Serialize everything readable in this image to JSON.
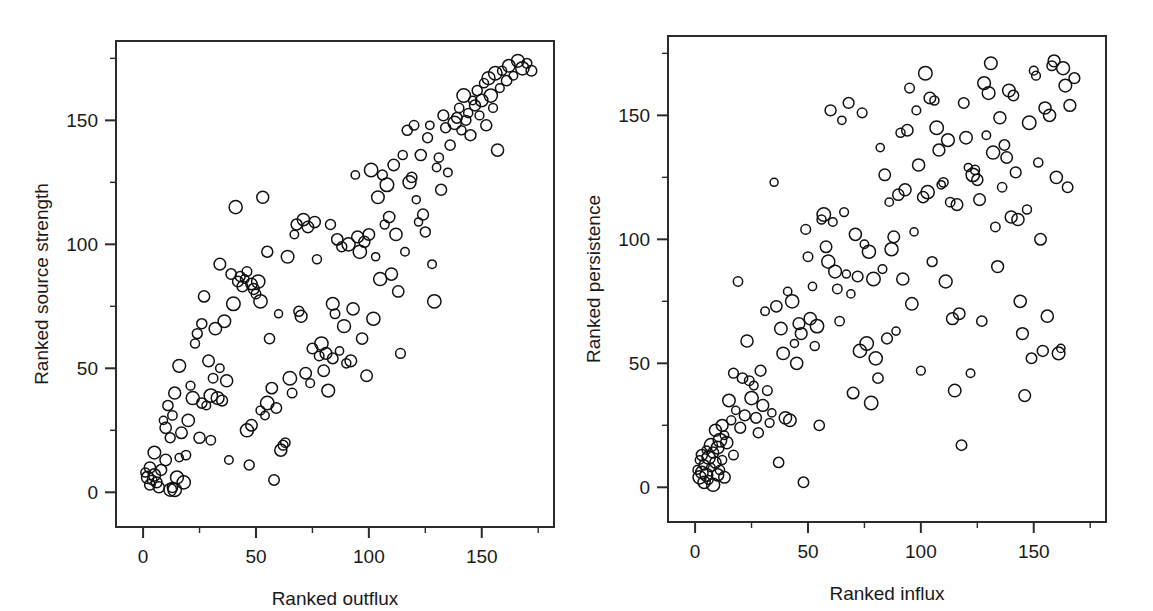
{
  "figure": {
    "background_color": "#fefefe",
    "marker_color": "#111111",
    "axis_color": "#2b2b2b",
    "marker_style": "open-circle"
  },
  "chart_data": [
    {
      "type": "scatter",
      "panel": "left",
      "title": "",
      "xlabel": "Ranked outflux",
      "ylabel": "Ranked source strength",
      "xlim": [
        -12,
        182
      ],
      "ylim": [
        -14,
        182
      ],
      "xticks": [
        0,
        50,
        100,
        150
      ],
      "yticks": [
        0,
        50,
        100,
        150
      ],
      "xticks_minor": [
        25,
        75,
        125,
        175
      ],
      "yticks_minor": [
        25,
        75,
        125,
        175
      ],
      "xtick_labels": [
        "0",
        "50",
        "100",
        "150"
      ],
      "ytick_labels": [
        "0",
        "50",
        "100",
        "150"
      ],
      "grid": false,
      "legend": "none",
      "n_points": 178,
      "points": [
        [
          1,
          8
        ],
        [
          2,
          6
        ],
        [
          3,
          10
        ],
        [
          3,
          3
        ],
        [
          4,
          5
        ],
        [
          5,
          16
        ],
        [
          5,
          7
        ],
        [
          6,
          4
        ],
        [
          7,
          2
        ],
        [
          8,
          9
        ],
        [
          9,
          29
        ],
        [
          10,
          26
        ],
        [
          10,
          13
        ],
        [
          11,
          35
        ],
        [
          12,
          1
        ],
        [
          12,
          22
        ],
        [
          13,
          2
        ],
        [
          13,
          31
        ],
        [
          14,
          1
        ],
        [
          14,
          40
        ],
        [
          15,
          6
        ],
        [
          16,
          51
        ],
        [
          16,
          14
        ],
        [
          17,
          24
        ],
        [
          18,
          4
        ],
        [
          19,
          15
        ],
        [
          20,
          29
        ],
        [
          21,
          43
        ],
        [
          22,
          38
        ],
        [
          23,
          60
        ],
        [
          24,
          64
        ],
        [
          25,
          22
        ],
        [
          26,
          68
        ],
        [
          26,
          36
        ],
        [
          27,
          79
        ],
        [
          28,
          35
        ],
        [
          29,
          53
        ],
        [
          30,
          39
        ],
        [
          30,
          21
        ],
        [
          31,
          46
        ],
        [
          32,
          66
        ],
        [
          33,
          38
        ],
        [
          34,
          92
        ],
        [
          34,
          50
        ],
        [
          35,
          37
        ],
        [
          36,
          69
        ],
        [
          37,
          45
        ],
        [
          38,
          13
        ],
        [
          39,
          88
        ],
        [
          40,
          76
        ],
        [
          41,
          115
        ],
        [
          42,
          85
        ],
        [
          43,
          87
        ],
        [
          44,
          83
        ],
        [
          45,
          86
        ],
        [
          46,
          25
        ],
        [
          46,
          89
        ],
        [
          47,
          11
        ],
        [
          48,
          27
        ],
        [
          48,
          84
        ],
        [
          49,
          82
        ],
        [
          50,
          80
        ],
        [
          51,
          85
        ],
        [
          52,
          77
        ],
        [
          52,
          33
        ],
        [
          53,
          119
        ],
        [
          54,
          31
        ],
        [
          55,
          36
        ],
        [
          55,
          97
        ],
        [
          56,
          62
        ],
        [
          57,
          42
        ],
        [
          58,
          5
        ],
        [
          59,
          34
        ],
        [
          60,
          72
        ],
        [
          61,
          17
        ],
        [
          62,
          19
        ],
        [
          63,
          20
        ],
        [
          64,
          95
        ],
        [
          65,
          46
        ],
        [
          66,
          40
        ],
        [
          67,
          104
        ],
        [
          68,
          108
        ],
        [
          69,
          73
        ],
        [
          70,
          71
        ],
        [
          71,
          110
        ],
        [
          72,
          48
        ],
        [
          73,
          107
        ],
        [
          74,
          44
        ],
        [
          75,
          58
        ],
        [
          76,
          109
        ],
        [
          77,
          94
        ],
        [
          78,
          55
        ],
        [
          79,
          60
        ],
        [
          80,
          49
        ],
        [
          81,
          56
        ],
        [
          82,
          41
        ],
        [
          83,
          108
        ],
        [
          84,
          76
        ],
        [
          84,
          54
        ],
        [
          85,
          72
        ],
        [
          86,
          102
        ],
        [
          87,
          57
        ],
        [
          88,
          99
        ],
        [
          89,
          67
        ],
        [
          90,
          52
        ],
        [
          91,
          100
        ],
        [
          92,
          53
        ],
        [
          93,
          74
        ],
        [
          94,
          128
        ],
        [
          95,
          103
        ],
        [
          96,
          97
        ],
        [
          97,
          62
        ],
        [
          98,
          101
        ],
        [
          99,
          47
        ],
        [
          100,
          104
        ],
        [
          101,
          130
        ],
        [
          102,
          70
        ],
        [
          103,
          95
        ],
        [
          104,
          119
        ],
        [
          105,
          86
        ],
        [
          106,
          128
        ],
        [
          107,
          108
        ],
        [
          108,
          124
        ],
        [
          109,
          111
        ],
        [
          110,
          88
        ],
        [
          111,
          132
        ],
        [
          112,
          104
        ],
        [
          113,
          81
        ],
        [
          114,
          56
        ],
        [
          115,
          136
        ],
        [
          116,
          97
        ],
        [
          117,
          146
        ],
        [
          118,
          125
        ],
        [
          119,
          127
        ],
        [
          120,
          148
        ],
        [
          121,
          118
        ],
        [
          122,
          109
        ],
        [
          123,
          136
        ],
        [
          124,
          112
        ],
        [
          125,
          105
        ],
        [
          126,
          143
        ],
        [
          127,
          148
        ],
        [
          128,
          92
        ],
        [
          129,
          77
        ],
        [
          130,
          131
        ],
        [
          131,
          135
        ],
        [
          132,
          122
        ],
        [
          133,
          152
        ],
        [
          134,
          147
        ],
        [
          135,
          129
        ],
        [
          136,
          140
        ],
        [
          138,
          149
        ],
        [
          139,
          151
        ],
        [
          140,
          155
        ],
        [
          141,
          146
        ],
        [
          142,
          160
        ],
        [
          143,
          150
        ],
        [
          144,
          153
        ],
        [
          145,
          144
        ],
        [
          146,
          158
        ],
        [
          147,
          156
        ],
        [
          148,
          162
        ],
        [
          149,
          152
        ],
        [
          150,
          158
        ],
        [
          151,
          165
        ],
        [
          152,
          148
        ],
        [
          153,
          167
        ],
        [
          154,
          160
        ],
        [
          155,
          155
        ],
        [
          156,
          169
        ],
        [
          157,
          138
        ],
        [
          158,
          163
        ],
        [
          159,
          170
        ],
        [
          161,
          166
        ],
        [
          162,
          172
        ],
        [
          164,
          168
        ],
        [
          166,
          174
        ],
        [
          168,
          171
        ],
        [
          170,
          173
        ],
        [
          172,
          170
        ]
      ]
    },
    {
      "type": "scatter",
      "panel": "right",
      "title": "",
      "xlabel": "Ranked influx",
      "ylabel": "Ranked persistence",
      "xlim": [
        -12,
        182
      ],
      "ylim": [
        -14,
        182
      ],
      "xticks": [
        0,
        50,
        100,
        150
      ],
      "yticks": [
        0,
        50,
        100,
        150
      ],
      "xticks_minor": [
        25,
        75,
        125,
        175
      ],
      "yticks_minor": [
        25,
        75,
        125,
        175
      ],
      "xtick_labels": [
        "0",
        "50",
        "100",
        "150"
      ],
      "ytick_labels": [
        "0",
        "50",
        "100",
        "150"
      ],
      "grid": false,
      "legend": "none",
      "n_points": 176,
      "points": [
        [
          1,
          7
        ],
        [
          2,
          11
        ],
        [
          2,
          4
        ],
        [
          3,
          13
        ],
        [
          3,
          6
        ],
        [
          4,
          9
        ],
        [
          4,
          2
        ],
        [
          5,
          15
        ],
        [
          5,
          5
        ],
        [
          6,
          12
        ],
        [
          6,
          3
        ],
        [
          7,
          17
        ],
        [
          7,
          8
        ],
        [
          8,
          14
        ],
        [
          8,
          1
        ],
        [
          9,
          10
        ],
        [
          9,
          23
        ],
        [
          10,
          16
        ],
        [
          10,
          5
        ],
        [
          11,
          19
        ],
        [
          11,
          7
        ],
        [
          12,
          25
        ],
        [
          12,
          11
        ],
        [
          13,
          21
        ],
        [
          13,
          4
        ],
        [
          14,
          18
        ],
        [
          15,
          35
        ],
        [
          16,
          27
        ],
        [
          17,
          46
        ],
        [
          17,
          13
        ],
        [
          18,
          31
        ],
        [
          19,
          83
        ],
        [
          20,
          24
        ],
        [
          21,
          44
        ],
        [
          22,
          29
        ],
        [
          23,
          59
        ],
        [
          24,
          43
        ],
        [
          25,
          36
        ],
        [
          26,
          41
        ],
        [
          27,
          28
        ],
        [
          28,
          22
        ],
        [
          29,
          47
        ],
        [
          30,
          33
        ],
        [
          31,
          71
        ],
        [
          32,
          39
        ],
        [
          33,
          26
        ],
        [
          34,
          30
        ],
        [
          35,
          123
        ],
        [
          36,
          73
        ],
        [
          37,
          10
        ],
        [
          38,
          64
        ],
        [
          39,
          54
        ],
        [
          40,
          28
        ],
        [
          41,
          79
        ],
        [
          42,
          27
        ],
        [
          43,
          75
        ],
        [
          44,
          58
        ],
        [
          45,
          50
        ],
        [
          46,
          66
        ],
        [
          47,
          62
        ],
        [
          48,
          2
        ],
        [
          49,
          104
        ],
        [
          50,
          93
        ],
        [
          51,
          68
        ],
        [
          52,
          81
        ],
        [
          53,
          57
        ],
        [
          54,
          65
        ],
        [
          55,
          25
        ],
        [
          56,
          108
        ],
        [
          57,
          110
        ],
        [
          58,
          97
        ],
        [
          59,
          91
        ],
        [
          60,
          152
        ],
        [
          61,
          107
        ],
        [
          62,
          87
        ],
        [
          63,
          80
        ],
        [
          64,
          67
        ],
        [
          65,
          148
        ],
        [
          66,
          111
        ],
        [
          67,
          86
        ],
        [
          68,
          155
        ],
        [
          69,
          78
        ],
        [
          70,
          38
        ],
        [
          71,
          102
        ],
        [
          72,
          85
        ],
        [
          73,
          55
        ],
        [
          74,
          151
        ],
        [
          75,
          98
        ],
        [
          76,
          58
        ],
        [
          77,
          95
        ],
        [
          78,
          34
        ],
        [
          79,
          84
        ],
        [
          80,
          52
        ],
        [
          81,
          44
        ],
        [
          82,
          137
        ],
        [
          83,
          88
        ],
        [
          84,
          126
        ],
        [
          85,
          60
        ],
        [
          86,
          115
        ],
        [
          87,
          96
        ],
        [
          88,
          101
        ],
        [
          89,
          63
        ],
        [
          90,
          118
        ],
        [
          91,
          143
        ],
        [
          92,
          84
        ],
        [
          93,
          120
        ],
        [
          94,
          144
        ],
        [
          95,
          161
        ],
        [
          96,
          74
        ],
        [
          97,
          103
        ],
        [
          98,
          152
        ],
        [
          99,
          130
        ],
        [
          100,
          47
        ],
        [
          101,
          117
        ],
        [
          102,
          167
        ],
        [
          103,
          119
        ],
        [
          104,
          157
        ],
        [
          105,
          91
        ],
        [
          106,
          156
        ],
        [
          107,
          145
        ],
        [
          108,
          136
        ],
        [
          109,
          122
        ],
        [
          110,
          123
        ],
        [
          111,
          83
        ],
        [
          112,
          140
        ],
        [
          113,
          115
        ],
        [
          114,
          68
        ],
        [
          115,
          39
        ],
        [
          116,
          114
        ],
        [
          117,
          70
        ],
        [
          118,
          17
        ],
        [
          119,
          155
        ],
        [
          120,
          141
        ],
        [
          121,
          129
        ],
        [
          122,
          46
        ],
        [
          123,
          126
        ],
        [
          124,
          128
        ],
        [
          125,
          124
        ],
        [
          126,
          116
        ],
        [
          127,
          67
        ],
        [
          128,
          163
        ],
        [
          129,
          142
        ],
        [
          130,
          159
        ],
        [
          131,
          171
        ],
        [
          132,
          135
        ],
        [
          133,
          105
        ],
        [
          134,
          89
        ],
        [
          135,
          149
        ],
        [
          136,
          121
        ],
        [
          137,
          138
        ],
        [
          138,
          133
        ],
        [
          139,
          160
        ],
        [
          140,
          109
        ],
        [
          141,
          158
        ],
        [
          142,
          127
        ],
        [
          143,
          108
        ],
        [
          144,
          75
        ],
        [
          145,
          62
        ],
        [
          146,
          37
        ],
        [
          147,
          112
        ],
        [
          148,
          147
        ],
        [
          149,
          52
        ],
        [
          150,
          168
        ],
        [
          151,
          166
        ],
        [
          152,
          131
        ],
        [
          153,
          100
        ],
        [
          154,
          55
        ],
        [
          155,
          153
        ],
        [
          156,
          69
        ],
        [
          157,
          150
        ],
        [
          158,
          170
        ],
        [
          159,
          172
        ],
        [
          160,
          125
        ],
        [
          161,
          54
        ],
        [
          162,
          56
        ],
        [
          163,
          169
        ],
        [
          164,
          162
        ],
        [
          165,
          121
        ],
        [
          166,
          154
        ],
        [
          168,
          165
        ]
      ]
    }
  ]
}
